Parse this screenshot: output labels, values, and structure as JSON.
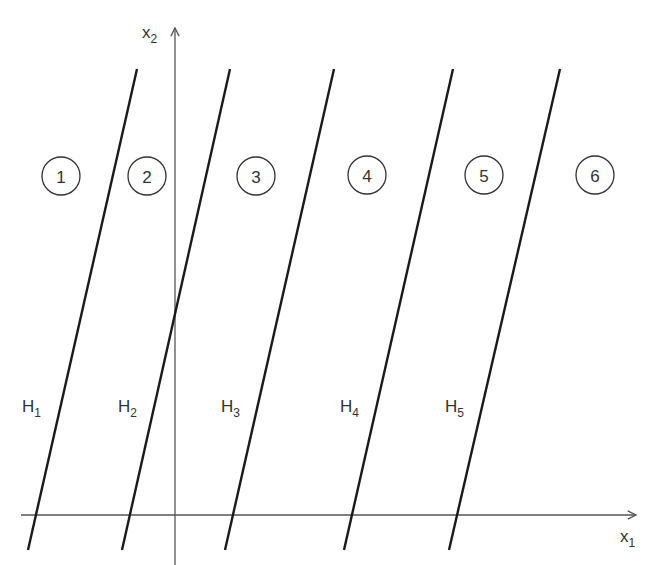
{
  "diagram": {
    "axes": {
      "x1": {
        "label": "x",
        "subscript": "1",
        "y": 515,
        "x_start": 21,
        "x_end": 636,
        "label_x": 620,
        "label_y": 542
      },
      "x2": {
        "label": "x",
        "subscript": "2",
        "x": 175,
        "y_start": 565,
        "y_end": 28,
        "label_x": 142,
        "label_y": 38
      }
    },
    "lines": [
      {
        "id": "H1",
        "label": "H",
        "subscript": "1",
        "x1": 137,
        "y1": 69,
        "x2": 28,
        "y2": 550,
        "label_x": 22,
        "label_y": 412
      },
      {
        "id": "H2",
        "label": "H",
        "subscript": "2",
        "x1": 230,
        "y1": 69,
        "x2": 122,
        "y2": 550,
        "label_x": 118,
        "label_y": 412
      },
      {
        "id": "H3",
        "label": "H",
        "subscript": "3",
        "x1": 334,
        "y1": 69,
        "x2": 225,
        "y2": 550,
        "label_x": 221,
        "label_y": 412
      },
      {
        "id": "H4",
        "label": "H",
        "subscript": "4",
        "x1": 453,
        "y1": 69,
        "x2": 344,
        "y2": 550,
        "label_x": 340,
        "label_y": 412
      },
      {
        "id": "H5",
        "label": "H",
        "subscript": "5",
        "x1": 560,
        "y1": 69,
        "x2": 449,
        "y2": 550,
        "label_x": 445,
        "label_y": 412
      }
    ],
    "regions": [
      {
        "number": "1",
        "cx": 61,
        "cy": 176
      },
      {
        "number": "2",
        "cx": 147,
        "cy": 176
      },
      {
        "number": "3",
        "cx": 256,
        "cy": 176
      },
      {
        "number": "4",
        "cx": 367,
        "cy": 175
      },
      {
        "number": "5",
        "cx": 484,
        "cy": 175
      },
      {
        "number": "6",
        "cx": 595,
        "cy": 175
      }
    ],
    "region_radius": 19,
    "colors": {
      "line": "#1a1a1a",
      "axis": "#555555",
      "text": "#333333",
      "background": "#ffffff"
    }
  }
}
